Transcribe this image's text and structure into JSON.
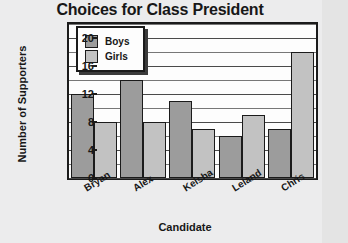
{
  "chart_data": {
    "type": "bar",
    "title": "Choices for Class President",
    "xlabel": "Candidate",
    "ylabel": "Number of Supporters",
    "categories": [
      "Bryan",
      "Alex",
      "Keisha",
      "Leland",
      "Chris"
    ],
    "series": [
      {
        "name": "Boys",
        "values": [
          12,
          14,
          11,
          6,
          7
        ],
        "color": "#9c9c9c"
      },
      {
        "name": "Girls",
        "values": [
          8,
          8,
          7,
          9,
          18
        ],
        "color": "#c2c2c2"
      }
    ],
    "ylim": [
      0,
      22
    ],
    "ytick_labels": [
      "0",
      "4",
      "8",
      "12",
      "16",
      "20"
    ],
    "ytick_values": [
      0,
      4,
      8,
      12,
      16,
      20
    ],
    "minor_tick_step": 2,
    "grid": true,
    "legend_position": "top-left"
  },
  "legend": {
    "items": [
      {
        "label": "Boys"
      },
      {
        "label": "Girls"
      }
    ]
  }
}
